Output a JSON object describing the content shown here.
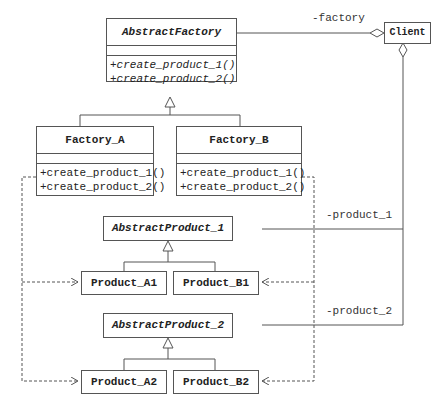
{
  "diagram": {
    "type": "uml-class-diagram",
    "pattern": "Abstract Factory",
    "classes": {
      "abstract_factory": {
        "name": "AbstractFactory",
        "abstract": true,
        "operations": [
          "+create_product_1()",
          "+create_product_2()"
        ]
      },
      "factory_a": {
        "name": "Factory_A",
        "operations": [
          "+create_product_1()",
          "+create_product_2()"
        ]
      },
      "factory_b": {
        "name": "Factory_B",
        "operations": [
          "+create_product_1()",
          "+create_product_2()"
        ]
      },
      "client": {
        "name": "Client"
      },
      "abstract_product_1": {
        "name": "AbstractProduct_1",
        "abstract": true
      },
      "product_a1": {
        "name": "Product_A1"
      },
      "product_b1": {
        "name": "Product_B1"
      },
      "abstract_product_2": {
        "name": "AbstractProduct_2",
        "abstract": true
      },
      "product_a2": {
        "name": "Product_A2"
      },
      "product_b2": {
        "name": "Product_B2"
      }
    },
    "associations": {
      "factory": "-factory",
      "product_1": "-product_1",
      "product_2": "-product_2"
    },
    "relations": [
      {
        "from": "Factory_A",
        "to": "AbstractFactory",
        "type": "generalization"
      },
      {
        "from": "Factory_B",
        "to": "AbstractFactory",
        "type": "generalization"
      },
      {
        "from": "Product_A1",
        "to": "AbstractProduct_1",
        "type": "generalization"
      },
      {
        "from": "Product_B1",
        "to": "AbstractProduct_1",
        "type": "generalization"
      },
      {
        "from": "Product_A2",
        "to": "AbstractProduct_2",
        "type": "generalization"
      },
      {
        "from": "Product_B2",
        "to": "AbstractProduct_2",
        "type": "generalization"
      },
      {
        "from": "Client",
        "to": "AbstractFactory",
        "type": "aggregation",
        "role": "-factory"
      },
      {
        "from": "Client",
        "to": "AbstractProduct_1",
        "type": "aggregation",
        "role": "-product_1"
      },
      {
        "from": "Client",
        "to": "AbstractProduct_2",
        "type": "aggregation",
        "role": "-product_2"
      },
      {
        "from": "Factory_A",
        "to": "Product_A1",
        "type": "dependency"
      },
      {
        "from": "Factory_A",
        "to": "Product_A2",
        "type": "dependency"
      },
      {
        "from": "Factory_B",
        "to": "Product_B1",
        "type": "dependency"
      },
      {
        "from": "Factory_B",
        "to": "Product_B2",
        "type": "dependency"
      }
    ]
  }
}
